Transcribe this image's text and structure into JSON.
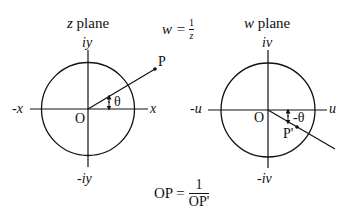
{
  "left_plane": {
    "title_var": "z",
    "title_word": "plane",
    "axis_pos_x": "x",
    "axis_neg_x": "-x",
    "axis_pos_y": "iy",
    "axis_neg_y": "-iy",
    "origin": "O",
    "point": "P",
    "angle": "θ"
  },
  "right_plane": {
    "title_var": "w",
    "title_word": "plane",
    "axis_pos_x": "u",
    "axis_neg_x": "-u",
    "axis_pos_y": "iv",
    "axis_neg_y": "-iv",
    "origin": "O",
    "point": "P'",
    "angle": "-θ"
  },
  "mapping_formula": {
    "lhs": "w =",
    "numerator": "1",
    "denominator": "z"
  },
  "distance_formula": {
    "lhs": "OP =",
    "numerator": "1",
    "denominator": "OP'"
  },
  "colors": {
    "stroke": "#111111",
    "background": "#ffffff"
  }
}
